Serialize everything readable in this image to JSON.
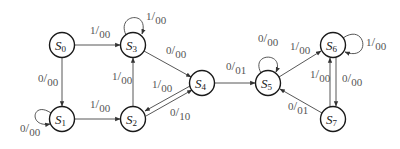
{
  "diagram": {
    "type": "state-transition",
    "states": [
      {
        "id": "S0",
        "name": "S",
        "sub": "0",
        "x": 62,
        "y": 45
      },
      {
        "id": "S1",
        "name": "S",
        "sub": "1",
        "x": 62,
        "y": 119
      },
      {
        "id": "S2",
        "name": "S",
        "sub": "2",
        "x": 133,
        "y": 119
      },
      {
        "id": "S3",
        "name": "S",
        "sub": "3",
        "x": 133,
        "y": 45
      },
      {
        "id": "S4",
        "name": "S",
        "sub": "4",
        "x": 202,
        "y": 83
      },
      {
        "id": "S5",
        "name": "S",
        "sub": "5",
        "x": 268,
        "y": 83
      },
      {
        "id": "S6",
        "name": "S",
        "sub": "6",
        "x": 333,
        "y": 45
      },
      {
        "id": "S7",
        "name": "S",
        "sub": "7",
        "x": 333,
        "y": 119
      }
    ],
    "transitions": [
      {
        "from": "S0",
        "to": "S3",
        "input": "1",
        "output": "00"
      },
      {
        "from": "S0",
        "to": "S1",
        "input": "0",
        "output": "00"
      },
      {
        "from": "S1",
        "to": "S1",
        "input": "0",
        "output": "00"
      },
      {
        "from": "S1",
        "to": "S2",
        "input": "1",
        "output": "00"
      },
      {
        "from": "S2",
        "to": "S3",
        "input": "1",
        "output": "00"
      },
      {
        "from": "S3",
        "to": "S3",
        "input": "1",
        "output": "00"
      },
      {
        "from": "S3",
        "to": "S4",
        "input": "0",
        "output": "00"
      },
      {
        "from": "S4",
        "to": "S2",
        "input": "1",
        "output": "00"
      },
      {
        "from": "S2",
        "to": "S4",
        "input": "0",
        "output": "10"
      },
      {
        "from": "S4",
        "to": "S5",
        "input": "0",
        "output": "01"
      },
      {
        "from": "S5",
        "to": "S5",
        "input": "0",
        "output": "00"
      },
      {
        "from": "S5",
        "to": "S6",
        "input": "1",
        "output": "00"
      },
      {
        "from": "S6",
        "to": "S6",
        "input": "1",
        "output": "00"
      },
      {
        "from": "S6",
        "to": "S7",
        "input": "0",
        "output": "00"
      },
      {
        "from": "S7",
        "to": "S6",
        "input": "1",
        "output": "00"
      },
      {
        "from": "S7",
        "to": "S5",
        "input": "0",
        "output": "01"
      }
    ],
    "labels": {
      "s0_s3": {
        "in": "1",
        "out": "00"
      },
      "s0_s1": {
        "in": "0",
        "out": "00"
      },
      "s1_loop": {
        "in": "0",
        "out": "00"
      },
      "s1_s2": {
        "in": "1",
        "out": "00"
      },
      "s2_s3": {
        "in": "1",
        "out": "00"
      },
      "s3_loop": {
        "in": "1",
        "out": "00"
      },
      "s3_s4": {
        "in": "0",
        "out": "00"
      },
      "s4_s2": {
        "in": "1",
        "out": "00"
      },
      "s2_s4": {
        "in": "0",
        "out": "10"
      },
      "s4_s5": {
        "in": "0",
        "out": "01"
      },
      "s5_loop": {
        "in": "0",
        "out": "00"
      },
      "s5_s6": {
        "in": "1",
        "out": "00"
      },
      "s6_loop": {
        "in": "1",
        "out": "00"
      },
      "s6_s7": {
        "in": "0",
        "out": "00"
      },
      "s7_s6": {
        "in": "1",
        "out": "00"
      },
      "s7_s5": {
        "in": "0",
        "out": "01"
      }
    },
    "state_labels": {
      "s0": {
        "name": "S",
        "sub": "0"
      },
      "s1": {
        "name": "S",
        "sub": "1"
      },
      "s2": {
        "name": "S",
        "sub": "2"
      },
      "s3": {
        "name": "S",
        "sub": "3"
      },
      "s4": {
        "name": "S",
        "sub": "4"
      },
      "s5": {
        "name": "S",
        "sub": "5"
      },
      "s6": {
        "name": "S",
        "sub": "6"
      },
      "s7": {
        "name": "S",
        "sub": "7"
      }
    },
    "slash": "/",
    "colors": {
      "stroke": "#1a1a1a",
      "edge": "#444444",
      "label": "#555555",
      "background": "#ffffff"
    }
  }
}
